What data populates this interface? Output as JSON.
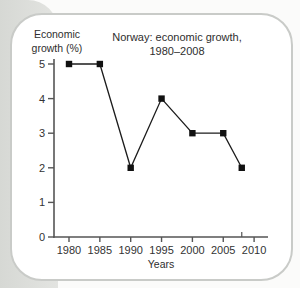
{
  "page": {
    "background_color": "#fbfbfa",
    "page_edge_color": "#dcdedb",
    "card_background": "#ffffff",
    "card_border_color": "#c9cbc8"
  },
  "chart_data": {
    "type": "line",
    "title_line1": "Norway: economic growth,",
    "title_line2": "1980–2008",
    "ylabel_line1": "Economic",
    "ylabel_line2": "growth (%)",
    "xlabel": "Years",
    "x": [
      1980,
      1985,
      1990,
      1995,
      2000,
      2005,
      2008
    ],
    "values": [
      5,
      5,
      2,
      4,
      3,
      3,
      2
    ],
    "xticks": [
      1980,
      1985,
      1990,
      1995,
      2000,
      2005,
      2010
    ],
    "yticks": [
      0,
      1,
      2,
      3,
      4,
      5
    ],
    "minor_xticks": [
      2008
    ],
    "xlim": [
      1978,
      2012
    ],
    "ylim": [
      0,
      5.2
    ],
    "grid": false,
    "legend": "none",
    "marker": "square",
    "line_color": "#1c1c1c",
    "marker_color": "#111111",
    "axis_color": "#555555",
    "text_color": "#333333"
  }
}
